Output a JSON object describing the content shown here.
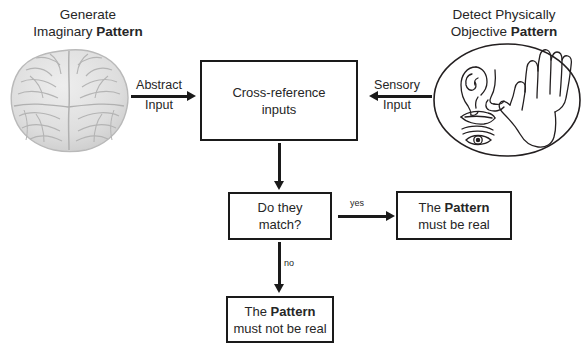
{
  "diagram": {
    "title_left": {
      "line1": "Generate",
      "line2_plain": "Imaginary ",
      "line2_bold": "Pattern"
    },
    "title_right": {
      "line1": "Detect Physically",
      "line2_plain": "Objective ",
      "line2_bold": "Pattern"
    },
    "nodes": {
      "cross_reference": {
        "line1": "Cross-reference",
        "line2": "inputs"
      },
      "decision": {
        "line1": "Do they",
        "line2": "match?"
      },
      "outcome_yes": {
        "plain1": "The ",
        "bold": "Pattern",
        "line2": "must be real"
      },
      "outcome_no": {
        "plain1": "The ",
        "bold": "Pattern",
        "line2": "must not be real"
      }
    },
    "edges": {
      "abstract_input": {
        "line1": "Abstract",
        "line2": "Input"
      },
      "sensory_input": {
        "line1": "Sensory",
        "line2": "Input"
      },
      "yes": "yes",
      "no": "no"
    },
    "illustrations": {
      "brain": "brain-illustration",
      "senses": "senses-oval-illustration"
    },
    "colors": {
      "stroke": "#1a1a1a",
      "text": "#262626",
      "brain_fill": "#dcdcdc",
      "brain_line": "#b4b4b4",
      "background": "#ffffff"
    }
  }
}
